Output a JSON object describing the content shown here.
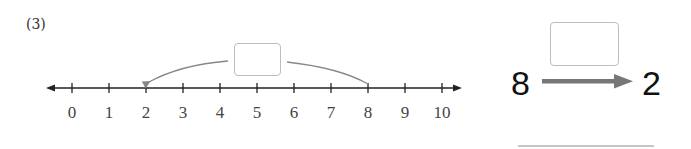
{
  "problem": {
    "number_label": "(3)"
  },
  "number_line": {
    "min": 0,
    "max": 10,
    "tick_labels": [
      "0",
      "1",
      "2",
      "3",
      "4",
      "5",
      "6",
      "7",
      "8",
      "9",
      "10"
    ],
    "jump_from": 8,
    "jump_to": 2,
    "jump_answer_box": ""
  },
  "equation": {
    "start_value": "8",
    "end_value": "2",
    "operation_answer_box": "",
    "answer_line": ""
  },
  "colors": {
    "axis": "#222222",
    "arc": "#888888",
    "arrow": "#777777",
    "box_border": "#bdbdbd"
  }
}
